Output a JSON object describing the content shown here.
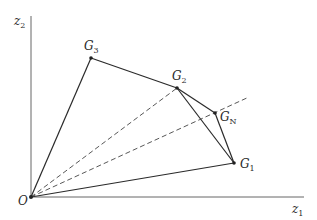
{
  "figure": {
    "axes": {
      "x_label": {
        "text": "z",
        "sub": "1"
      },
      "y_label": {
        "text": "z",
        "sub": "2"
      },
      "origin_label": "O"
    },
    "points": [
      {
        "id": "G3",
        "text": "G",
        "sub": "3",
        "x": 91,
        "y": 58
      },
      {
        "id": "G2",
        "text": "G",
        "sub": "2",
        "x": 177,
        "y": 88
      },
      {
        "id": "GN",
        "text": "G",
        "sub": "N",
        "x": 215,
        "y": 113
      },
      {
        "id": "G1",
        "text": "G",
        "sub": "1",
        "x": 234,
        "y": 163
      }
    ],
    "colors": {
      "line": "#2a2a2a",
      "axis": "#555555",
      "dashed": "#444444"
    }
  }
}
